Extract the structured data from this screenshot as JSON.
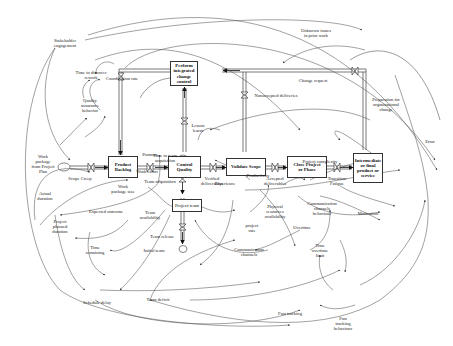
{
  "diagram": {
    "type": "system-dynamics-stock-flow",
    "stocks": [
      {
        "id": "product_backlog",
        "label": "Product\nBacklog"
      },
      {
        "id": "control_quality",
        "label": "Control\nQuality"
      },
      {
        "id": "validate_scope",
        "label": "Validate Scope"
      },
      {
        "id": "close_project",
        "label": "Close Project\nor Phase"
      },
      {
        "id": "intermediate",
        "label": "Intermediate\nor final\nproduct or\nservice"
      },
      {
        "id": "integrated_change",
        "label": "Perform\nintegrated\nchange\ncontrol"
      },
      {
        "id": "project_team",
        "label": "Project team"
      }
    ],
    "flows": [
      {
        "id": "scope_creep",
        "label": "Scope Creep"
      },
      {
        "id": "promote",
        "label": "Promote"
      },
      {
        "id": "verified",
        "label": "Verified\ndeliverables"
      },
      {
        "id": "accepted",
        "label": "Accepted\ndeliverables"
      },
      {
        "id": "transition",
        "label": "Transition"
      },
      {
        "id": "lesson_learnt",
        "label": "Lesson\nlearnt"
      },
      {
        "id": "nonaccepted",
        "label": "Nonaccepted deliveries"
      },
      {
        "id": "change_request",
        "label": "Change request"
      },
      {
        "id": "coordination_rate",
        "label": "Coordination rate"
      },
      {
        "id": "team_acquisition",
        "label": "Team acquisition"
      },
      {
        "id": "team_release",
        "label": "Team release"
      }
    ],
    "variables": [
      {
        "id": "stakeholder",
        "label": "Stakeholder\nengagement"
      },
      {
        "id": "time_discover",
        "label": "Time to discover\nrework"
      },
      {
        "id": "quality_behavior",
        "label": "Quality\nassurance\nbehavior"
      },
      {
        "id": "unknown_issues",
        "label": "Unknown issues\nin prior work"
      },
      {
        "id": "prep_org_change",
        "label": "Preparation for\norganizational\nchange"
      },
      {
        "id": "error",
        "label": "Error"
      },
      {
        "id": "work_package_plan",
        "label": "Work\npackage\nfrom Project\nPlan"
      },
      {
        "id": "actual_duration",
        "label": "Actual\nduration"
      },
      {
        "id": "work_package_size",
        "label": "Work\npackage size"
      },
      {
        "id": "expected_outcome",
        "label": "Expected outcome"
      },
      {
        "id": "work_effort",
        "label": "Work effort"
      },
      {
        "id": "time_team_acq",
        "label": "Time to team\nacquisition"
      },
      {
        "id": "team_availability",
        "label": "Team\navailability"
      },
      {
        "id": "initial_team",
        "label": "Initial team"
      },
      {
        "id": "experience",
        "label": "Experience"
      },
      {
        "id": "productivity",
        "label": "Productivity"
      },
      {
        "id": "project_complexity",
        "label": "Project complexity"
      },
      {
        "id": "fatigue",
        "label": "Fatigue"
      },
      {
        "id": "motivation",
        "label": "Motivation"
      },
      {
        "id": "comm_behaviour",
        "label": "Communication\nchannels\nbehaviour"
      },
      {
        "id": "physical_resources",
        "label": "Physical\nresources\navailability"
      },
      {
        "id": "project_rate",
        "label": "project\nrate"
      },
      {
        "id": "overtime",
        "label": "Overtime"
      },
      {
        "id": "time_overtime",
        "label": "Time\novertime\nlimit"
      },
      {
        "id": "comm_channels",
        "label": "Communication\nchannels"
      },
      {
        "id": "project_planned",
        "label": "Project\nplanned\nduration"
      },
      {
        "id": "time_remaining",
        "label": "Time\nremaining"
      },
      {
        "id": "schedule_delay",
        "label": "Schedule delay"
      },
      {
        "id": "team_deficit",
        "label": "Team deficit"
      },
      {
        "id": "fast_tracking",
        "label": "Fast tracking"
      },
      {
        "id": "fast_tracking_behaviour",
        "label": "Fast\ntracking\nbehaviour"
      }
    ],
    "colors": {
      "line": "#444444",
      "pipe": "#555555",
      "text": "#222222"
    }
  }
}
